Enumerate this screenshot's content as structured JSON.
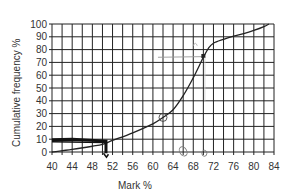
{
  "chart_data": {
    "type": "line",
    "title": "",
    "xlabel": "Mark %",
    "ylabel": "Cumulative frequency %",
    "xlim": [
      40,
      84
    ],
    "ylim": [
      0,
      100
    ],
    "grid": true,
    "x_grid_step": 2,
    "y_grid_step": 10,
    "x_ticks": [
      40,
      44,
      48,
      52,
      56,
      60,
      64,
      68,
      72,
      76,
      80,
      84
    ],
    "y_ticks": [
      0,
      10,
      20,
      30,
      40,
      50,
      60,
      70,
      80,
      90,
      100
    ],
    "series": [
      {
        "name": "Cumulative frequency",
        "x": [
          40,
          44,
          48,
          50,
          52,
          56,
          60,
          62,
          64,
          66,
          68,
          70,
          71,
          72,
          74,
          76,
          78,
          80,
          82,
          83
        ],
        "values": [
          0,
          2,
          4.5,
          6,
          9,
          15,
          22,
          27,
          33,
          44,
          58,
          74,
          81,
          85,
          88,
          90.5,
          92.5,
          95,
          98,
          100
        ]
      }
    ],
    "annotations": [
      {
        "type": "handwritten-line",
        "description": "thick horizontal pen line at y≈10 from x=40 to x≈51, then down to x-axis",
        "x": 51,
        "y": 10
      },
      {
        "type": "circle-mark",
        "x": 62,
        "y": 27
      },
      {
        "type": "arrow-mark",
        "x": 70,
        "y": 75
      },
      {
        "type": "circle-mark",
        "x": 66,
        "y": 0
      },
      {
        "type": "circle-mark",
        "x": 70,
        "y": 0
      }
    ]
  }
}
